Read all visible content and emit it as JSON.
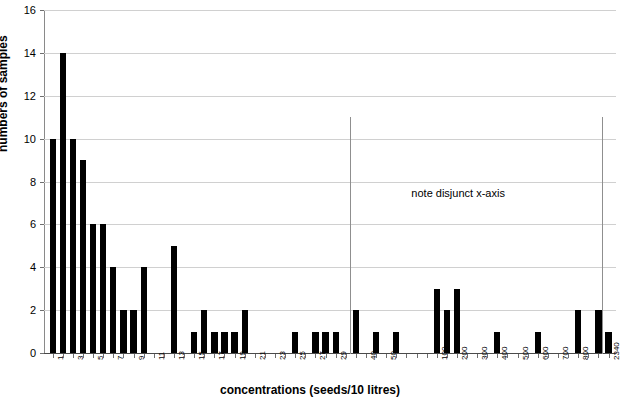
{
  "chart_data": {
    "type": "bar",
    "title": "",
    "xlabel": "concentrations (seeds/10 litres)",
    "ylabel": "numbers of samples",
    "ylim": [
      0,
      16
    ],
    "yticks": [
      0,
      2,
      4,
      6,
      8,
      10,
      12,
      14,
      16
    ],
    "grid": true,
    "legend": null,
    "annotations": [
      {
        "text": "note disjunct x-axis",
        "x_category": "100",
        "y": 7
      }
    ],
    "axis_breaks": [
      {
        "after_category": "30",
        "before_category": "35"
      },
      {
        "after_category": "900",
        "before_category": "2340"
      }
    ],
    "categories": [
      "1",
      "2",
      "3",
      "4",
      "5",
      "6",
      "7",
      "8",
      "9",
      "10",
      "11",
      "12",
      "13",
      "14",
      "15",
      "16",
      "17",
      "18",
      "19",
      "20",
      "21",
      "22",
      "23",
      "24",
      "25",
      "26",
      "27",
      "28",
      "29",
      "30",
      "35",
      "40",
      "45",
      "50",
      "60",
      "70",
      "80",
      "90",
      "100",
      "150",
      "200",
      "250",
      "300",
      "350",
      "400",
      "450",
      "500",
      "550",
      "600",
      "650",
      "700",
      "750",
      "800",
      "850",
      "900",
      "2340"
    ],
    "values": [
      10,
      14,
      10,
      9,
      6,
      6,
      4,
      2,
      2,
      4,
      0,
      0,
      5,
      0,
      1,
      2,
      1,
      1,
      1,
      2,
      0,
      0,
      0,
      0,
      1,
      0,
      1,
      1,
      1,
      0,
      2,
      0,
      1,
      0,
      1,
      0,
      0,
      0,
      3,
      2,
      3,
      0,
      0,
      0,
      1,
      0,
      0,
      0,
      1,
      0,
      0,
      0,
      2,
      0,
      2,
      1
    ],
    "visible_tick_labels": [
      "1",
      "3",
      "5",
      "7",
      "9",
      "11",
      "13",
      "15",
      "17",
      "19",
      "21",
      "23",
      "25",
      "27",
      "29",
      "40",
      "50",
      "100",
      "200",
      "300",
      "400",
      "500",
      "600",
      "700",
      "800",
      "2340"
    ]
  },
  "axis_titles": {
    "x": "concentrations (seeds/10 litres)",
    "y": "numbers of samples"
  },
  "annotation": {
    "disjunct_note": "note disjunct x-axis"
  },
  "y_axis": {
    "ticks": [
      "0",
      "2",
      "4",
      "6",
      "8",
      "10",
      "12",
      "14",
      "16"
    ]
  },
  "x_axis": {
    "labels": [
      "1",
      "3",
      "5",
      "7",
      "9",
      "11",
      "13",
      "15",
      "17",
      "19",
      "21",
      "23",
      "25",
      "27",
      "29",
      "40",
      "50",
      "100",
      "200",
      "300",
      "400",
      "500",
      "600",
      "700",
      "800",
      "2340"
    ]
  },
  "colors": {
    "bar": "#000000",
    "grid": "#d0d0d0",
    "axis": "#6f6f6f",
    "background": "#ffffff"
  }
}
